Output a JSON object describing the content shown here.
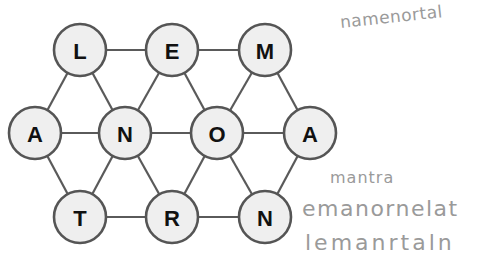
{
  "puzzle": {
    "type": "hexagonal letter grid",
    "nodes": [
      {
        "id": "n0",
        "letter": "L",
        "x": 80,
        "y": 50
      },
      {
        "id": "n1",
        "letter": "E",
        "x": 172,
        "y": 50
      },
      {
        "id": "n2",
        "letter": "M",
        "x": 265,
        "y": 50
      },
      {
        "id": "n3",
        "letter": "A",
        "x": 35,
        "y": 133
      },
      {
        "id": "n4",
        "letter": "N",
        "x": 125,
        "y": 133
      },
      {
        "id": "n5",
        "letter": "O",
        "x": 217,
        "y": 133
      },
      {
        "id": "n6",
        "letter": "A",
        "x": 310,
        "y": 133
      },
      {
        "id": "n7",
        "letter": "T",
        "x": 80,
        "y": 217
      },
      {
        "id": "n8",
        "letter": "R",
        "x": 172,
        "y": 217
      },
      {
        "id": "n9",
        "letter": "N",
        "x": 265,
        "y": 217
      }
    ],
    "edges": [
      [
        "n0",
        "n1"
      ],
      [
        "n1",
        "n2"
      ],
      [
        "n3",
        "n4"
      ],
      [
        "n4",
        "n5"
      ],
      [
        "n5",
        "n6"
      ],
      [
        "n7",
        "n8"
      ],
      [
        "n8",
        "n9"
      ],
      [
        "n0",
        "n3"
      ],
      [
        "n0",
        "n4"
      ],
      [
        "n1",
        "n4"
      ],
      [
        "n1",
        "n5"
      ],
      [
        "n2",
        "n5"
      ],
      [
        "n2",
        "n6"
      ],
      [
        "n3",
        "n7"
      ],
      [
        "n4",
        "n7"
      ],
      [
        "n4",
        "n8"
      ],
      [
        "n5",
        "n8"
      ],
      [
        "n5",
        "n9"
      ],
      [
        "n6",
        "n9"
      ]
    ],
    "node_radius": 26
  },
  "handwritten_notes": [
    {
      "text": "namenortal"
    },
    {
      "text": "mantra"
    },
    {
      "text": "emanornelat"
    },
    {
      "text": "lemanrtaln"
    }
  ],
  "colors": {
    "node_fill": "#efefef",
    "node_stroke": "#555555",
    "edge": "#5a5a5a",
    "letter": "#111111",
    "handwriting": "#9a9a9a"
  }
}
